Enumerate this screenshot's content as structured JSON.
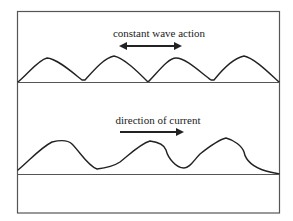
{
  "diagram": {
    "top_panel": {
      "label": "constant wave action",
      "arrow": "double-headed horizontal arrow",
      "description": "symmetric ripple profile above sediment surface"
    },
    "bottom_panel": {
      "label": "direction of current",
      "arrow": "single-headed arrow pointing right",
      "description": "asymmetric ripple profile above sediment surface"
    },
    "colors": {
      "line": "#222222",
      "frame": "#555555",
      "background": "#ffffff"
    }
  }
}
